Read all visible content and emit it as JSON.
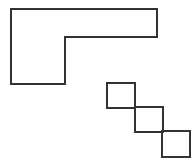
{
  "figure": {
    "title": "",
    "background_color": "#ffffff",
    "stroke_color": "#333333",
    "stroke_width": 2,
    "width": 196,
    "height": 161
  },
  "shapes": {
    "l_shape": {
      "name": "L-shaped polygon",
      "type": "polygon",
      "fill": "none",
      "points": "11,9 157,9 157,37 65,37 65,84 11,84",
      "vertices": [
        [
          11,
          9
        ],
        [
          157,
          9
        ],
        [
          157,
          37
        ],
        [
          65,
          37
        ],
        [
          65,
          84
        ],
        [
          11,
          84
        ]
      ]
    },
    "squares": [
      {
        "name": "square-top-left",
        "type": "rect",
        "fill": "none",
        "x": 107,
        "y": 83,
        "width": 28,
        "height": 25
      },
      {
        "name": "square-middle",
        "type": "rect",
        "fill": "none",
        "x": 135,
        "y": 107,
        "width": 28,
        "height": 25
      },
      {
        "name": "square-bottom-right",
        "type": "rect",
        "fill": "none",
        "x": 162,
        "y": 131,
        "width": 28,
        "height": 26
      }
    ]
  },
  "chart_data": {
    "type": "table",
    "title": "",
    "xlabel": "",
    "ylabel": "",
    "categories": [
      "L-shaped polygon",
      "square-top-left",
      "square-middle",
      "square-bottom-right"
    ],
    "values": [
      6,
      4,
      4,
      4
    ],
    "series": [
      {
        "name": "vertex count",
        "values": [
          6,
          4,
          4,
          4
        ]
      }
    ],
    "annotations": []
  }
}
